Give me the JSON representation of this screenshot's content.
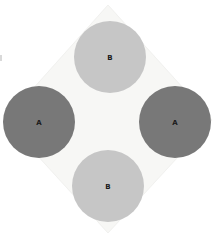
{
  "figure": {
    "background_color": "#ffffff",
    "width": 218,
    "height": 239,
    "plate": {
      "name": "rotated-square-plate",
      "fill_color": "#f7f7f5",
      "stroke_color": "#f1f1ef",
      "points": "108,5 212,120 108,233 5,120"
    },
    "circles": [
      {
        "id": "circle-top",
        "label": "B",
        "group": "B",
        "fill_color": "#c6c6c6",
        "cx": 110,
        "cy": 57,
        "r": 36,
        "position": "top"
      },
      {
        "id": "circle-right",
        "label": "A",
        "group": "A",
        "fill_color": "#787878",
        "cx": 175,
        "cy": 122,
        "r": 36,
        "position": "right"
      },
      {
        "id": "circle-bottom",
        "label": "B",
        "group": "B",
        "fill_color": "#c6c6c6",
        "cx": 108,
        "cy": 186,
        "r": 36,
        "position": "bottom"
      },
      {
        "id": "circle-left",
        "label": "A",
        "group": "A",
        "fill_color": "#787878",
        "cx": 39,
        "cy": 122,
        "r": 36,
        "position": "left"
      }
    ],
    "legend": {
      "group_a_color": "#787878",
      "group_b_color": "#c6c6c6",
      "group_a_label": "A",
      "group_b_label": "B"
    },
    "artifact": {
      "name": "left-edge-mark",
      "color": "#b9b9b9"
    }
  }
}
